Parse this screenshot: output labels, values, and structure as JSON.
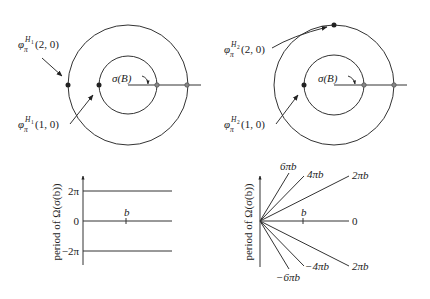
{
  "panels": {
    "top_left": {
      "label_outer": {
        "phi": "φ",
        "sub": "π",
        "sup": "H",
        "supsub": "1",
        "args": "(2, 0)"
      },
      "label_inner": {
        "phi": "φ",
        "sub": "π",
        "sup": "H",
        "supsub": "1",
        "args": "(1, 0)"
      },
      "sigma_label": "σ(B)"
    },
    "top_right": {
      "label_outer": {
        "phi": "φ",
        "sub": "π",
        "sup": "H",
        "supsub": "2",
        "args": "(2, 0)"
      },
      "label_inner": {
        "phi": "φ",
        "sub": "π",
        "sup": "H",
        "supsub": "2",
        "args": "(1, 0)"
      },
      "sigma_label": "σ(B)"
    },
    "bottom_left": {
      "ylabel": "period of Ω(σ(b))",
      "ticks": [
        "2π",
        "0",
        "−2π"
      ],
      "point_label": "b"
    },
    "bottom_right": {
      "ylabel": "period of Ω(σ(b))",
      "point_label": "b",
      "line_labels": {
        "l6": "6πb",
        "l4": "4πb",
        "l2": "2πb",
        "l0": "0",
        "m2": "2πb",
        "m4": "−4πb",
        "m6": "−6πb"
      }
    }
  }
}
